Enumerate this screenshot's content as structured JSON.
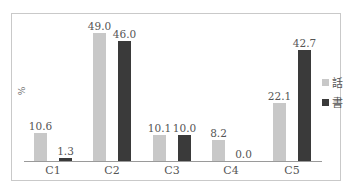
{
  "chart_data": {
    "type": "bar",
    "title": "",
    "xlabel": "",
    "ylabel": "%",
    "categories": [
      "C1",
      "C2",
      "C3",
      "C4",
      "C5"
    ],
    "series": [
      {
        "name": "話",
        "color": "#c8c8c8",
        "values": [
          10.6,
          49.0,
          10.1,
          8.2,
          22.1
        ]
      },
      {
        "name": "書",
        "color": "#3a3a3a",
        "values": [
          1.3,
          46.0,
          10.0,
          0.0,
          42.7
        ]
      }
    ],
    "value_labels": {
      "話": [
        "10.6",
        "49.0",
        "10.1",
        "8.2",
        "22.1"
      ],
      "書": [
        "1.3",
        "46.0",
        "10.0",
        "0.0",
        "42.7"
      ]
    },
    "ylim": [
      0,
      50
    ],
    "grid": false,
    "legend_position": "right"
  }
}
